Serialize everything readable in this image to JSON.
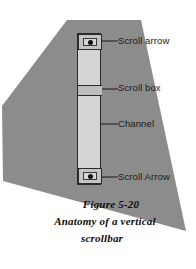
{
  "figure": {
    "background_color": "#ffffff",
    "shape_color": "#8c8c8c",
    "line_color": "#2b2b2b",
    "channel_color": "#d4d4d4",
    "scroll_box_color": "#bdbdbd",
    "arrow_glyph": "arrow-glyph"
  },
  "scrollbar": {
    "orientation": "vertical",
    "top_arrow_name": "scroll-arrow-up",
    "bottom_arrow_name": "scroll-arrow-down",
    "channel_name": "channel",
    "scroll_box_name": "scroll-box"
  },
  "labels": [
    {
      "id": "scroll-arrow-top",
      "text": "Scroll arrow"
    },
    {
      "id": "scroll-box",
      "text": "Scroll box"
    },
    {
      "id": "channel",
      "text": "Channel"
    },
    {
      "id": "scroll-arrow-bot",
      "text": "Scroll Arrow"
    }
  ],
  "caption": {
    "line1": "Figure 5-20",
    "line2": "Anatomy of a vertical",
    "line3": "scrollbar"
  }
}
